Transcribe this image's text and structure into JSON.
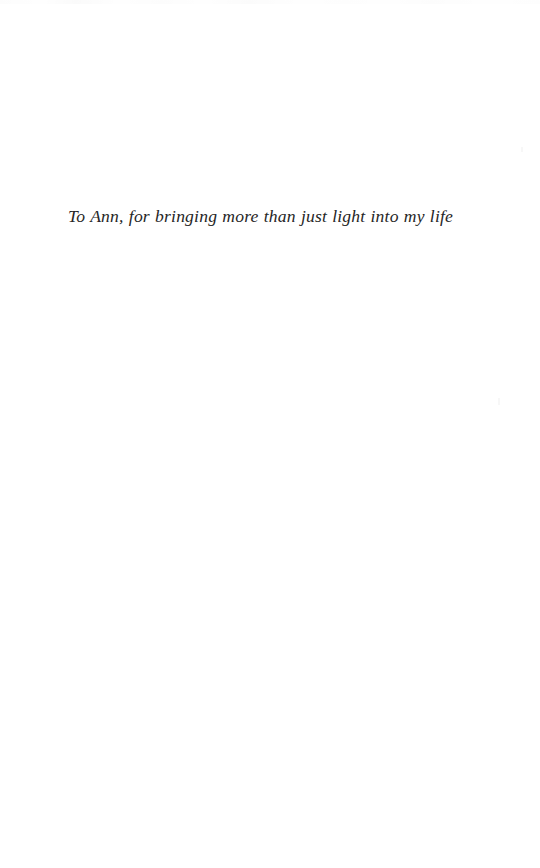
{
  "page": {
    "kind": "book-dedication-page",
    "background_color": "#ffffff",
    "text_color": "#262626",
    "width": 540,
    "height": 868
  },
  "dedication": {
    "text": "To Ann, for bringing more than just light into my life"
  }
}
